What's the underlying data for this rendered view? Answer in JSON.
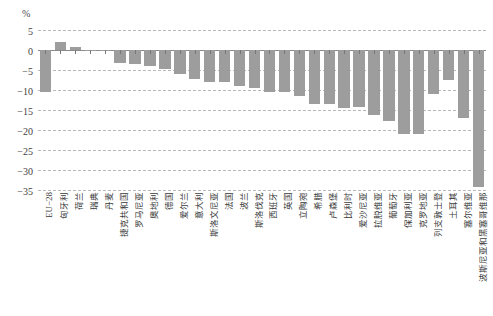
{
  "chart_data": {
    "type": "bar",
    "title": "",
    "xlabel": "",
    "ylabel": "%",
    "unit_label": "%",
    "ylim": [
      -35,
      5
    ],
    "ytick_labels": [
      "5",
      "0",
      "−5",
      "−10",
      "−15",
      "−20",
      "−25",
      "−30",
      "−35"
    ],
    "ytick_values": [
      5,
      0,
      -5,
      -10,
      -15,
      -20,
      -25,
      -30,
      -35
    ],
    "grid": true,
    "legend": "none",
    "bar_color": "#9d9d9d",
    "categories": [
      "EU−28",
      "匈牙利",
      "荷兰",
      "瑞典",
      "丹麦",
      "捷克共和国",
      "罗马尼亚",
      "奥地利",
      "德国",
      "爱尔兰",
      "意大利",
      "斯洛文尼亚",
      "法国",
      "波兰",
      "斯洛伐克",
      "西班牙",
      "英国",
      "立陶宛",
      "希腊",
      "卢森堡",
      "比利时",
      "爱沙尼亚",
      "拉脱维亚",
      "葡萄牙",
      "保加利亚",
      "克罗地亚",
      "列支敦士登",
      "土耳其",
      "塞尔维亚",
      "波斯尼亚和黑塞哥维那"
    ],
    "values": [
      -10.5,
      2.0,
      0.7,
      0.0,
      -0.3,
      -3.2,
      -3.6,
      -4.1,
      -4.8,
      -6.1,
      -7.2,
      -8.0,
      -8.0,
      -9.1,
      -9.6,
      -10.5,
      -10.4,
      -11.6,
      -13.4,
      -13.6,
      -14.6,
      -14.2,
      -16.3,
      -17.7,
      -21.0,
      -21.0,
      -11.0,
      -7.6,
      -17.1,
      -34.3
    ]
  }
}
